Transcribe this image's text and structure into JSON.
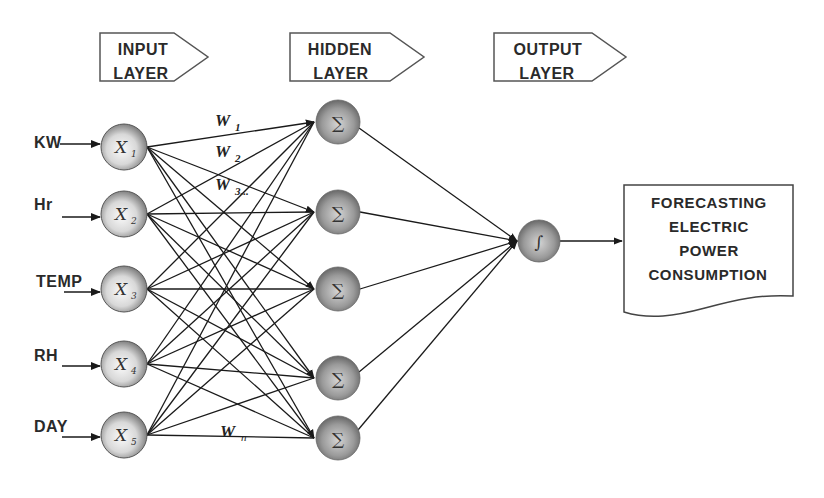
{
  "banners": [
    {
      "id": "input",
      "line1": "INPUT",
      "line2": "LAYER"
    },
    {
      "id": "hidden",
      "line1": "HIDDEN",
      "line2": "LAYER"
    },
    {
      "id": "output",
      "line1": "OUTPUT",
      "line2": "LAYER"
    }
  ],
  "inputs": [
    {
      "label": "KW",
      "node": "X",
      "sub": "1"
    },
    {
      "label": "Hr",
      "node": "X",
      "sub": "2"
    },
    {
      "label": "TEMP",
      "node": "X",
      "sub": "3"
    },
    {
      "label": "RH",
      "node": "X",
      "sub": "4"
    },
    {
      "label": "DAY",
      "node": "X",
      "sub": "5"
    }
  ],
  "hidden_nodes": [
    {
      "symbol": "∑"
    },
    {
      "symbol": "∑"
    },
    {
      "symbol": "∑"
    },
    {
      "symbol": "∑"
    },
    {
      "symbol": "∑"
    }
  ],
  "output_node": {
    "symbol": "∫"
  },
  "weights": [
    {
      "w": "W",
      "sub": "1"
    },
    {
      "w": "W",
      "sub": "2"
    },
    {
      "w": "W",
      "sub": "3..."
    },
    {
      "w": "W",
      "sub": "n"
    }
  ],
  "result_box": {
    "lines": [
      "FORECASTING",
      "ELECTRIC",
      "POWER",
      "CONSUMPTION"
    ]
  },
  "colors": {
    "line": "#1a1a1a",
    "node_light": "#f4f4f4",
    "node_dark": "#7a7a7a",
    "hidden_light": "#c8c8c8",
    "hidden_dark": "#6a6a6a",
    "border": "#555555"
  }
}
